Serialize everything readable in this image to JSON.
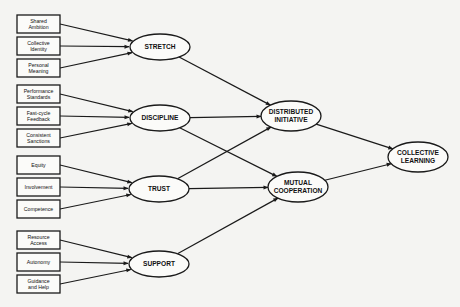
{
  "diagram": {
    "type": "path-diagram",
    "input_boxes": [
      {
        "id": "shared-ambition",
        "lines": [
          "Shared",
          "Ambition"
        ],
        "x": 17,
        "y": 15,
        "target": "stretch"
      },
      {
        "id": "collective-identity",
        "lines": [
          "Collective",
          "Identity"
        ],
        "x": 17,
        "y": 37,
        "target": "stretch"
      },
      {
        "id": "personal-meaning",
        "lines": [
          "Personal",
          "Meaning"
        ],
        "x": 17,
        "y": 59,
        "target": "stretch"
      },
      {
        "id": "performance-standards",
        "lines": [
          "Performance",
          "Standards"
        ],
        "x": 17,
        "y": 85,
        "target": "discipline"
      },
      {
        "id": "fast-cycle-feedback",
        "lines": [
          "Fast-cycle",
          "Feedback"
        ],
        "x": 17,
        "y": 107,
        "target": "discipline"
      },
      {
        "id": "consistent-sanctions",
        "lines": [
          "Consistent",
          "Sanctions"
        ],
        "x": 17,
        "y": 129,
        "target": "discipline"
      },
      {
        "id": "equity",
        "lines": [
          "Equity"
        ],
        "x": 17,
        "y": 156,
        "target": "trust"
      },
      {
        "id": "involvement",
        "lines": [
          "Involvement"
        ],
        "x": 17,
        "y": 178,
        "target": "trust"
      },
      {
        "id": "competence",
        "lines": [
          "Competence"
        ],
        "x": 17,
        "y": 200,
        "target": "trust"
      },
      {
        "id": "resource-access",
        "lines": [
          "Resource",
          "Access"
        ],
        "x": 17,
        "y": 231,
        "target": "support"
      },
      {
        "id": "autonomy",
        "lines": [
          "Autonomy"
        ],
        "x": 17,
        "y": 253,
        "target": "support"
      },
      {
        "id": "guidance-and-help",
        "lines": [
          "Guidance",
          "and Help"
        ],
        "x": 17,
        "y": 275,
        "target": "support"
      }
    ],
    "nodes": [
      {
        "id": "stretch",
        "lines": [
          "STRETCH"
        ],
        "cx": 160,
        "cy": 47,
        "rx": 30,
        "ry": 13
      },
      {
        "id": "discipline",
        "lines": [
          "DISCIPLINE"
        ],
        "cx": 160,
        "cy": 118,
        "rx": 30,
        "ry": 13
      },
      {
        "id": "trust",
        "lines": [
          "TRUST"
        ],
        "cx": 159,
        "cy": 189,
        "rx": 30,
        "ry": 13
      },
      {
        "id": "support",
        "lines": [
          "SUPPORT"
        ],
        "cx": 159,
        "cy": 264,
        "rx": 30,
        "ry": 13
      },
      {
        "id": "distributed-initiative",
        "lines": [
          "DISTRIBUTED",
          "INITIATIVE"
        ],
        "cx": 291,
        "cy": 116,
        "rx": 30,
        "ry": 15
      },
      {
        "id": "mutual-cooperation",
        "lines": [
          "MUTUAL",
          "COOPERATION"
        ],
        "cx": 298,
        "cy": 187,
        "rx": 30,
        "ry": 15
      },
      {
        "id": "collective-learning",
        "lines": [
          "COLLECTIVE",
          "LEARNING"
        ],
        "cx": 418,
        "cy": 157,
        "rx": 30,
        "ry": 15
      }
    ],
    "edges": [
      {
        "from": "stretch",
        "to": "distributed-initiative"
      },
      {
        "from": "discipline",
        "to": "distributed-initiative"
      },
      {
        "from": "discipline",
        "to": "mutual-cooperation"
      },
      {
        "from": "trust",
        "to": "distributed-initiative"
      },
      {
        "from": "trust",
        "to": "mutual-cooperation"
      },
      {
        "from": "support",
        "to": "mutual-cooperation"
      },
      {
        "from": "distributed-initiative",
        "to": "collective-learning"
      },
      {
        "from": "mutual-cooperation",
        "to": "collective-learning"
      }
    ],
    "colors": {
      "line": "#1a1a1a",
      "background": "#f4f4f2",
      "fill": "#fbfbf9"
    }
  }
}
